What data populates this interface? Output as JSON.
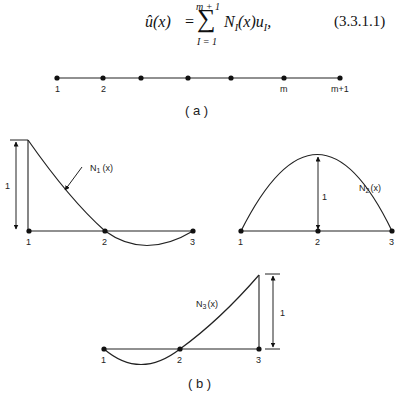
{
  "equation": {
    "lhs": "û(x)",
    "equals": "=",
    "sum_symbol": "∑",
    "sum_upper": "m + 1",
    "sum_lower": "I = 1",
    "rhs": "N_I(x)u_I,",
    "rhs_display": "NI(x)uI,",
    "number": "(3.3.1.1)"
  },
  "figure_a": {
    "caption": "( a )",
    "nodes": [
      {
        "label": "1",
        "x": 57
      },
      {
        "label": "2",
        "x": 103
      },
      {
        "label": "",
        "x": 141
      },
      {
        "label": "",
        "x": 188
      },
      {
        "label": "",
        "x": 231
      },
      {
        "label": "m",
        "x": 284
      },
      {
        "label": "m+1",
        "x": 340
      }
    ]
  },
  "figure_b": {
    "caption": "( b )",
    "plots": [
      {
        "name": "N1",
        "label": "N1(x)",
        "label_main": "N",
        "label_sub": "1",
        "label_tail": "(x)",
        "node_labels": [
          "1",
          "2",
          "3"
        ],
        "height_label": "1"
      },
      {
        "name": "N2",
        "label": "N2(x)",
        "label_main": "N",
        "label_sub": "2",
        "label_tail": "(x)",
        "node_labels": [
          "1",
          "2",
          "3"
        ],
        "height_label": "1"
      },
      {
        "name": "N3",
        "label": "N3(x)",
        "label_main": "N",
        "label_sub": "3",
        "label_tail": "(x)",
        "node_labels": [
          "1",
          "2",
          "3"
        ],
        "height_label": "1"
      }
    ]
  },
  "colors": {
    "ink": "#111111",
    "background": "#ffffff"
  }
}
